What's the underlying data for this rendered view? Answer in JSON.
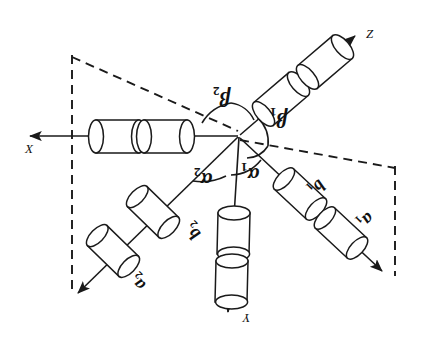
{
  "figure": {
    "type": "vector-diagram",
    "title": "",
    "background_color": "#ffffff",
    "stroke_color": "#1a1a1a",
    "fill_color": "#ffffff"
  },
  "axes": [
    {
      "id": "x",
      "label": "X",
      "direction": "left",
      "tip": [
        18,
        135
      ]
    },
    {
      "id": "y",
      "label": "Y",
      "direction": "down",
      "tip": [
        228,
        322
      ]
    },
    {
      "id": "z",
      "label": "Z",
      "direction": "upper-right",
      "tip": [
        362,
        28
      ]
    }
  ],
  "branches": [
    {
      "id": "b2",
      "label": "b",
      "subscript": "2",
      "direction": "lower-left",
      "x": 188,
      "y": 222
    },
    {
      "id": "a2",
      "label": "a",
      "subscript": "2",
      "direction": "lower-left",
      "x": 133,
      "y": 273
    },
    {
      "id": "b1",
      "label": "b",
      "subscript": "1",
      "direction": "lower-right",
      "x": 311,
      "y": 178
    },
    {
      "id": "a1",
      "label": "a",
      "subscript": "1",
      "direction": "lower-right",
      "x": 360,
      "y": 211
    }
  ],
  "angles": [
    {
      "id": "beta2",
      "label": "β",
      "subscript": "2",
      "x": 215,
      "y": 88,
      "between": "x-axis and z-axis"
    },
    {
      "id": "beta1",
      "label": "β",
      "subscript": "1",
      "x": 272,
      "y": 108,
      "between": "z-axis and b1 branch"
    },
    {
      "id": "alpha1",
      "label": "α",
      "subscript": "1",
      "x": 243,
      "y": 163,
      "between": "y-axis and b1 branch"
    },
    {
      "id": "alpha2",
      "label": "α",
      "subscript": "2",
      "x": 196,
      "y": 168,
      "between": "y-axis and b2 branch"
    }
  ],
  "cylinders": {
    "count_per_ray": 2,
    "rays": [
      "x",
      "y",
      "z",
      "b1-a1",
      "b2-a2"
    ],
    "total": 10
  },
  "guides": {
    "style": "dashed",
    "segments": [
      "vertical left edge",
      "diagonal from upper-left to origin",
      "diagonal from origin to lower-right",
      "vertical right edge"
    ]
  }
}
